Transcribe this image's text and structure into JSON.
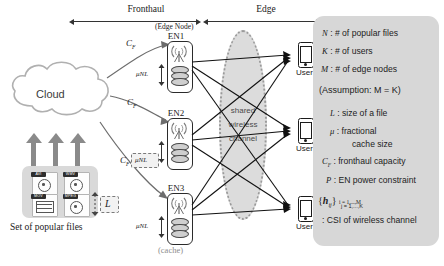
{
  "figure": {
    "spans": [
      {
        "label": "Fronthaul"
      },
      {
        "label": "Edge"
      }
    ],
    "cloud": {
      "label": "Cloud"
    },
    "files": {
      "caption": "Set of popular files",
      "size_symbol": "L",
      "items": [
        {
          "format": "AVI",
          "icon": "film-reel-icon"
        },
        {
          "format": "WMV",
          "icon": "film-reel-icon"
        },
        {
          "format": "MOV",
          "icon": "film-strip-icon"
        },
        {
          "format": "MPEG",
          "icon": "film-reel-icon"
        }
      ]
    },
    "edge_nodes": {
      "group_label": "(Edge Node)",
      "cache_label": "(cache)",
      "cache_size_symbol": "μNL",
      "nodes": [
        {
          "name": "EN1",
          "cache_label": "μNL"
        },
        {
          "name": "EN2",
          "cache_label": "μNL"
        },
        {
          "name": "EN3",
          "cache_label": "μNL"
        }
      ]
    },
    "fronthaul_links": [
      {
        "label": "C_F",
        "symbol": "C",
        "sub": "F"
      },
      {
        "label": "C_F",
        "symbol": "C",
        "sub": "F"
      },
      {
        "label": "C_F",
        "symbol": "C",
        "sub": "F"
      }
    ],
    "channel": {
      "line1": "shared",
      "line2": "wireless",
      "line3": "channel"
    },
    "users": [
      {
        "label": "User 1"
      },
      {
        "label": "User 2"
      },
      {
        "label": "User 3"
      }
    ]
  },
  "legend": {
    "rows": [
      {
        "sym": "N",
        "sep": ":",
        "text": "# of popular files"
      },
      {
        "sym": "K",
        "sep": ":",
        "text": "# of users"
      },
      {
        "sym": "M",
        "sep": ":",
        "text": "# of edge nodes"
      },
      {
        "sym": "",
        "sep": "",
        "text": "(Assumption:  M = K)"
      },
      {
        "sym": "L",
        "sep": ":",
        "text": "size of a file"
      },
      {
        "sym": "μ",
        "sep": ":",
        "text": "fractional"
      },
      {
        "sym": "",
        "sep": "",
        "text": "cache size"
      },
      {
        "sym": "C_F",
        "sep": ":",
        "text": "fronthaul capacity"
      },
      {
        "sym": "P",
        "sep": ":",
        "text": "EN power constraint"
      },
      {
        "sym": "{h_ij}",
        "sep": "",
        "text": ""
      },
      {
        "sym": "",
        "sep": ":",
        "text": "CSI of wireless channel"
      }
    ],
    "h_index_top": "i = 1,...,M",
    "h_index_bottom": "j = 1,...,K"
  },
  "colors": {
    "legend_bg": "#d7d7d7",
    "files_bg": "#d9d9d9",
    "channel_fill": "#dcdcdc",
    "channel_border": "#9a9a9a",
    "arrow_gray": "#8a8a8a",
    "line": "#333333"
  }
}
